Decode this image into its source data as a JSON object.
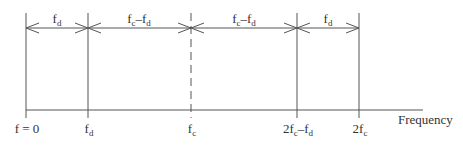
{
  "diagram": {
    "axis_label": "Frequency",
    "colors": {
      "line": "#555555",
      "text": "#333333",
      "background": "#ffffff"
    },
    "markers": [
      {
        "id": "f0",
        "label_base": "f = 0",
        "label_sub": "",
        "x": 26,
        "style": "solid"
      },
      {
        "id": "fd",
        "label_base": "f",
        "label_sub": "d",
        "x": 88,
        "style": "solid"
      },
      {
        "id": "fc",
        "label_base": "f",
        "label_sub": "c",
        "x": 191,
        "style": "dashed"
      },
      {
        "id": "2fc-fd",
        "label_base": "2f",
        "label_sub": "c",
        "label_tail": "–f",
        "label_tail_sub": "d",
        "x": 297,
        "style": "solid"
      },
      {
        "id": "2fc",
        "label_base": "2f",
        "label_sub": "c",
        "x": 359,
        "style": "solid"
      }
    ],
    "spans": [
      {
        "from": "f0",
        "to": "fd",
        "label_base": "f",
        "label_sub": "d"
      },
      {
        "from": "fd",
        "to": "fc",
        "label_base": "f",
        "label_sub": "c",
        "label_tail": "–f",
        "label_tail_sub": "d"
      },
      {
        "from": "fc",
        "to": "2fc-fd",
        "label_base": "f",
        "label_sub": "c",
        "label_tail": "–f",
        "label_tail_sub": "d"
      },
      {
        "from": "2fc-fd",
        "to": "2fc",
        "label_base": "f",
        "label_sub": "d"
      }
    ]
  }
}
